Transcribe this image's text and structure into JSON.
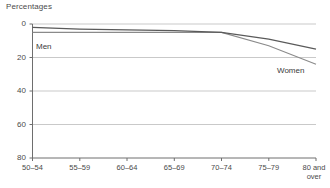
{
  "chart": {
    "title": "Percentages"
  },
  "axes": {
    "y_ticks": [
      "80",
      "60",
      "40",
      "20",
      "0"
    ],
    "x_ticks": [
      {
        "line1": "50–54",
        "line2": ""
      },
      {
        "line1": "55–59",
        "line2": ""
      },
      {
        "line1": "60–64",
        "line2": ""
      },
      {
        "line1": "65–69",
        "line2": ""
      },
      {
        "line1": "70–74",
        "line2": ""
      },
      {
        "line1": "75–79",
        "line2": ""
      },
      {
        "line1": "80 and",
        "line2": "over"
      }
    ]
  },
  "series_labels": {
    "men": "Men",
    "women": "Women"
  },
  "colors": {
    "men_line": "#5a5a5a",
    "women_line": "#8a8a8a",
    "gridline": "#c9c9c9",
    "axis": "#6e6e6e",
    "text": "#4a4a4a"
  },
  "chart_data": {
    "type": "line",
    "title": "Percentages",
    "xlabel": "",
    "ylabel": "Percentages",
    "ylim": [
      0,
      80
    ],
    "yticks": [
      0,
      20,
      40,
      60,
      80
    ],
    "grid": true,
    "legend": "inline-labels",
    "categories": [
      "50–54",
      "55–59",
      "60–64",
      "65–69",
      "70–74",
      "75–79",
      "80 and over"
    ],
    "series": [
      {
        "name": "Men",
        "values": [
          78,
          77,
          76.5,
          76,
          75,
          71,
          65
        ]
      },
      {
        "name": "Women",
        "values": [
          75,
          75,
          75,
          75,
          75,
          67,
          56
        ]
      }
    ],
    "annotations": [
      {
        "text": "Men",
        "near_category": "55–59"
      },
      {
        "text": "Women",
        "near_category": "80 and over"
      }
    ]
  }
}
